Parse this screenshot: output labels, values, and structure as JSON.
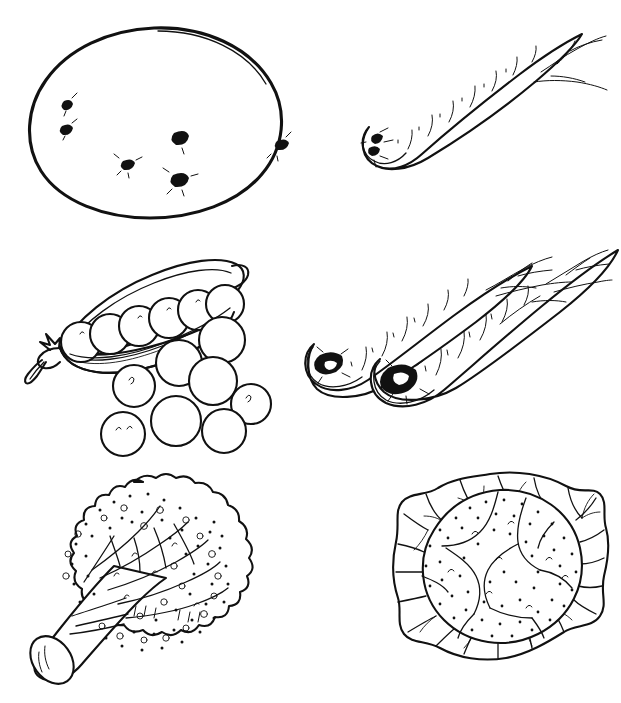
{
  "page": {
    "kind": "line-drawing",
    "background_color": "#ffffff",
    "ink_color": "#111111",
    "width": 621,
    "height": 703,
    "columns": 2,
    "rows": 3
  },
  "items": [
    {
      "id": "potato",
      "name": "potato",
      "icon": "potato-icon",
      "row": 1,
      "column": 1,
      "style": "outline with dark eyes",
      "detail_count": 6,
      "detail_label": "eyes"
    },
    {
      "id": "carrot",
      "name": "carrot",
      "icon": "carrot-icon",
      "row": 1,
      "column": 2,
      "style": "single tapered root pointing up-right",
      "detail_count": 1,
      "detail_label": "root"
    },
    {
      "id": "peapod",
      "name": "pea pod with loose peas",
      "icon": "pea-pod-icon",
      "row": 2,
      "column": 1,
      "style": "open pod with peas inside and scattered peas",
      "detail_count": 8,
      "detail_label": "loose peas",
      "peas_in_pod": 6
    },
    {
      "id": "parsnips",
      "name": "parsnips",
      "icon": "parsnip-icon",
      "row": 2,
      "column": 2,
      "style": "two tapered roots pointing up-right",
      "detail_count": 2,
      "detail_label": "roots"
    },
    {
      "id": "broccoli",
      "name": "broccoli",
      "icon": "broccoli-icon",
      "row": 3,
      "column": 1,
      "style": "floret head with cut stalk to lower left",
      "detail_count": 1,
      "detail_label": "head"
    },
    {
      "id": "cauliflower",
      "name": "cauliflower",
      "icon": "cauliflower-icon",
      "row": 3,
      "column": 2,
      "style": "round curd head wrapped in veined leaves",
      "detail_count": 1,
      "detail_label": "head"
    }
  ],
  "potato": {
    "eyes": [
      {
        "cx": 46,
        "cy": 84
      },
      {
        "cx": 45,
        "cy": 109
      },
      {
        "cx": 106,
        "cy": 144
      },
      {
        "cx": 159,
        "cy": 118
      },
      {
        "cx": 158,
        "cy": 159
      },
      {
        "cx": 260,
        "cy": 124
      }
    ]
  },
  "peapod": {
    "pod_peas": [
      {
        "cx": 57,
        "cy": 92,
        "r": 20
      },
      {
        "cx": 86,
        "cy": 84,
        "r": 20
      },
      {
        "cx": 115,
        "cy": 76,
        "r": 20
      },
      {
        "cx": 145,
        "cy": 68,
        "r": 20
      },
      {
        "cx": 174,
        "cy": 60,
        "r": 20
      },
      {
        "cx": 201,
        "cy": 54,
        "r": 19
      }
    ],
    "loose_peas": [
      {
        "cx": 198,
        "cy": 90,
        "r": 23
      },
      {
        "cx": 155,
        "cy": 113,
        "r": 23
      },
      {
        "cx": 189,
        "cy": 131,
        "r": 24
      },
      {
        "cx": 110,
        "cy": 136,
        "r": 21
      },
      {
        "cx": 227,
        "cy": 154,
        "r": 20
      },
      {
        "cx": 152,
        "cy": 171,
        "r": 25
      },
      {
        "cx": 200,
        "cy": 181,
        "r": 22
      },
      {
        "cx": 99,
        "cy": 184,
        "r": 22
      }
    ]
  }
}
